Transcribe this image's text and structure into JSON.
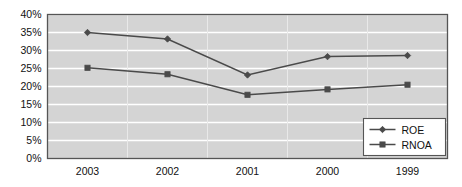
{
  "chart_data": {
    "type": "line",
    "title": "",
    "subtitle": "",
    "xlabel": "",
    "ylabel": "",
    "categories": [
      "2003",
      "2002",
      "2001",
      "2000",
      "1999"
    ],
    "ylim": [
      0,
      40
    ],
    "ytick_values": [
      0,
      5,
      10,
      15,
      20,
      25,
      30,
      35,
      40
    ],
    "ytick_labels": [
      "0%",
      "5%",
      "10%",
      "15%",
      "20%",
      "25%",
      "30%",
      "35%",
      "40%"
    ],
    "xtick_labels": [
      "2003",
      "2002",
      "2001",
      "2000",
      "1999"
    ],
    "grid": "horizontal",
    "legend_position": "bottom-right",
    "plot_background": "#d4d4d4",
    "gridline_color": "#ffffff",
    "axis_color": "#555555",
    "series": [
      {
        "name": "ROE",
        "marker": "diamond",
        "color": "#4a4a4a",
        "values": [
          35.0,
          33.2,
          23.2,
          28.3,
          28.6
        ]
      },
      {
        "name": "RNOA",
        "marker": "square",
        "color": "#4a4a4a",
        "values": [
          25.2,
          23.4,
          17.7,
          19.2,
          20.5
        ]
      }
    ]
  },
  "legend": {
    "entries": [
      {
        "label": "ROE",
        "marker": "diamond-marker-icon"
      },
      {
        "label": "RNOA",
        "marker": "square-marker-icon"
      }
    ]
  }
}
